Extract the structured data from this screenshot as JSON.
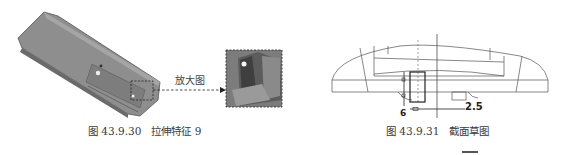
{
  "figure_left": {
    "callout_label": "放大图",
    "caption_prefix": "图 43.9.30",
    "caption_title": "拉伸特征 9"
  },
  "figure_right": {
    "dimension_horizontal": "2.5",
    "dimension_vertical": "6",
    "caption_prefix": "图 43.9.31",
    "caption_title": "截面草图"
  },
  "colors": {
    "part_gray": "#8c8c8c",
    "part_dark": "#5e5e5e",
    "line": "#444444"
  }
}
